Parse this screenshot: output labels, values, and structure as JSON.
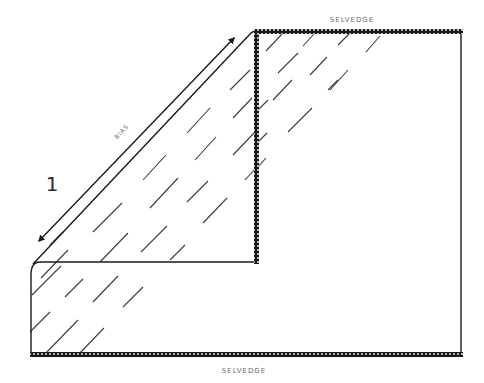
{
  "diagram": {
    "step_number": "1",
    "labels": {
      "selvedge_top": "SELVEDGE",
      "selvedge_bottom": "SELVEDGE",
      "bias": "BIAS"
    },
    "colors": {
      "line": "#1a1a1a",
      "hatch": "#3a3a3a",
      "label": "#6a6a6a",
      "background": "#ffffff"
    }
  }
}
